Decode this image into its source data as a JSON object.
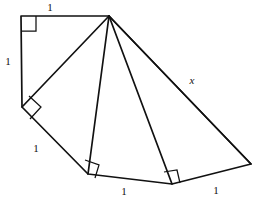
{
  "figure": {
    "kind": "spiral-of-theodorus",
    "canvas": {
      "width": 262,
      "height": 204
    },
    "stroke_color": "#111111",
    "background_color": "#ffffff",
    "apex": {
      "name": "apex",
      "x": 109,
      "y": 16
    },
    "vertices": [
      {
        "name": "top-left-corner",
        "x": 21,
        "y": 16
      },
      {
        "name": "apex",
        "x": 109,
        "y": 16
      },
      {
        "name": "left-corner",
        "x": 22,
        "y": 107
      },
      {
        "name": "bottom-left-corner",
        "x": 88,
        "y": 174
      },
      {
        "name": "bottom-mid-corner",
        "x": 172,
        "y": 184
      },
      {
        "name": "right-corner",
        "x": 251,
        "y": 164
      }
    ],
    "outline_path": "M 21 16 L 109 16 L 251 164 L 172 184 L 88 174 L 22 107 Z",
    "spokes": [
      {
        "name": "spoke-to-left-corner",
        "path": "M 109 16 L 22 107"
      },
      {
        "name": "spoke-to-bottom-left-corner",
        "path": "M 109 16 L 88 174"
      },
      {
        "name": "spoke-to-bottom-mid-corner",
        "path": "M 109 16 L 172 184"
      },
      {
        "name": "spoke-to-right-corner",
        "path": "M 109 16 L 251 164"
      }
    ],
    "right_angles": [
      {
        "name": "right-angle-top-left",
        "path": "M 21 31 L 36 31 L 36 16"
      },
      {
        "name": "right-angle-left",
        "path": "M 29 96 L 41 107 L 30 119"
      },
      {
        "name": "right-angle-bottom-left",
        "path": "M 85 160 L 99 165 L 95 178"
      },
      {
        "name": "right-angle-bottom-mid",
        "path": "M 164 172 L 177 170 L 180 183"
      }
    ],
    "labels": [
      {
        "name": "label-top-edge",
        "text": "1",
        "x": 50,
        "y": 7,
        "style": "upright"
      },
      {
        "name": "label-left-edge",
        "text": "1",
        "x": 8,
        "y": 61,
        "style": "upright"
      },
      {
        "name": "label-lower-left-edge",
        "text": "1",
        "x": 36,
        "y": 148,
        "style": "upright"
      },
      {
        "name": "label-bottom-edge",
        "text": "1",
        "x": 124,
        "y": 191,
        "style": "upright"
      },
      {
        "name": "label-bottom-right-edge",
        "text": "1",
        "x": 216,
        "y": 190,
        "style": "upright"
      },
      {
        "name": "label-hypotenuse-x",
        "text": "x",
        "x": 192,
        "y": 80,
        "style": "italic"
      }
    ]
  }
}
